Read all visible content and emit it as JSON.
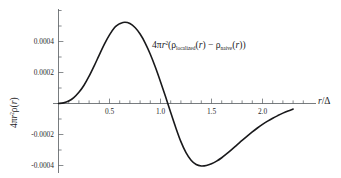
{
  "chart_data": {
    "type": "line",
    "title": "",
    "subtitle": "",
    "xlabel": "r/Δ",
    "ylabel": "4πr²ρ(r)",
    "annotation": "4πr²(ρ_localized(r) − ρ_naive(r))",
    "annotation_parts": {
      "prefix": "4",
      "pi": "π",
      "r": "r",
      "exp": "2",
      "open": "(",
      "rho1": "ρ",
      "sub1": "localized",
      "arg1": "(r)",
      "minus": "−",
      "rho2": "ρ",
      "sub2": "naive",
      "arg2": "(r)",
      "close": ")"
    },
    "xlim": [
      -0.06,
      2.33
    ],
    "ylim": [
      -0.00057,
      0.00062
    ],
    "xticks": [
      0.5,
      1.0,
      1.5,
      2.0
    ],
    "xticklabels": [
      "0.5",
      "1.0",
      "1.5",
      "2.0"
    ],
    "yticks": [
      0.0004,
      0.0002,
      -0.0002,
      -0.0004
    ],
    "yticklabels": [
      "0.0004",
      "0.0002",
      "-0.0002",
      "-0.0004"
    ],
    "grid": false,
    "legend": null,
    "line_color": "#19191b",
    "axis_color": "#555a5e",
    "background": "#ffffff",
    "series": [
      {
        "name": "4πr²(ρ_localized − ρ_naive)",
        "x": [
          0.0,
          0.05,
          0.1,
          0.15,
          0.2,
          0.25,
          0.3,
          0.35,
          0.4,
          0.45,
          0.5,
          0.55,
          0.58,
          0.6,
          0.65,
          0.7,
          0.75,
          0.8,
          0.85,
          0.9,
          0.95,
          1.0,
          1.05,
          1.1,
          1.15,
          1.2,
          1.25,
          1.3,
          1.35,
          1.4,
          1.45,
          1.5,
          1.55,
          1.6,
          1.65,
          1.7,
          1.75,
          1.8,
          1.85,
          1.9,
          1.95,
          2.0,
          2.05,
          2.1,
          2.15,
          2.2,
          2.25,
          2.3
        ],
        "y": [
          0.0,
          4e-06,
          1.6e-05,
          3.8e-05,
          7.2e-05,
          0.000118,
          0.000176,
          0.000243,
          0.000314,
          0.000383,
          0.000443,
          0.00049,
          0.000507,
          0.000515,
          0.000524,
          0.000516,
          0.00049,
          0.000448,
          0.00039,
          0.000318,
          0.000234,
          0.000141,
          4.3e-05,
          -5.8e-05,
          -0.000156,
          -0.000246,
          -0.000317,
          -0.000366,
          -0.000394,
          -0.000403,
          -0.0004,
          -0.000389,
          -0.000372,
          -0.00035,
          -0.000324,
          -0.000296,
          -0.000267,
          -0.000238,
          -0.00021,
          -0.000183,
          -0.000158,
          -0.000135,
          -0.000114,
          -9.5e-05,
          -7.8e-05,
          -6.2e-05,
          -4.8e-05,
          -3.6e-05
        ]
      }
    ],
    "features": {
      "peak_x": 0.58,
      "peak_y": 0.00053,
      "trough_x": 1.44,
      "trough_y": -0.0004,
      "zero_crossing_x": 1.02,
      "start_x": 0.0,
      "start_y": 0.0
    }
  }
}
